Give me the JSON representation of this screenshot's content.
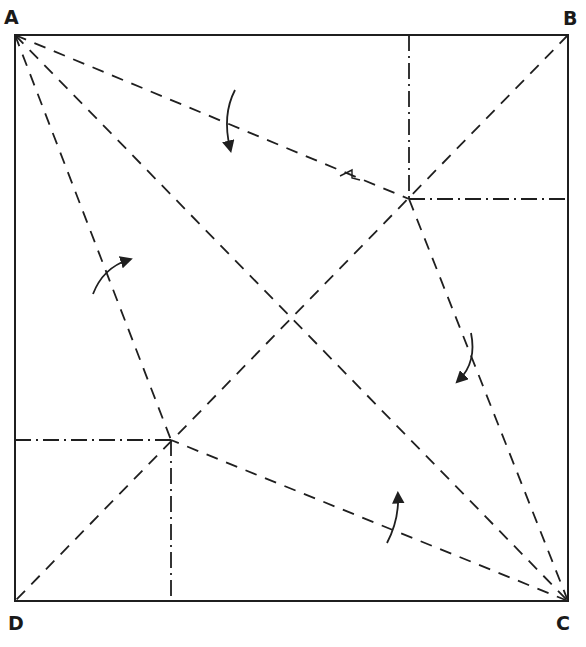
{
  "diagram": {
    "type": "origami-crease-pattern",
    "colors": {
      "line": "#1f1f1f",
      "background": "#ffffff"
    },
    "corners": {
      "A": {
        "label": "A",
        "x": 15,
        "y": 35
      },
      "B": {
        "label": "B",
        "x": 568,
        "y": 35
      },
      "C": {
        "label": "C",
        "x": 568,
        "y": 601
      },
      "D": {
        "label": "D",
        "x": 15,
        "y": 601
      }
    },
    "points": {
      "E": {
        "x": 409,
        "y": 199
      },
      "F": {
        "x": 171,
        "y": 440
      }
    },
    "valley_folds": [
      {
        "from": "A",
        "to": "C"
      },
      {
        "from": "B",
        "to": "D"
      },
      {
        "from": "A",
        "to": "E"
      },
      {
        "from": "A",
        "to": "F"
      },
      {
        "from": "C",
        "to": "E"
      },
      {
        "from": "C",
        "to": "F"
      }
    ],
    "mountain_folds": [
      {
        "from": [
          409,
          35
        ],
        "to": [
          409,
          199
        ]
      },
      {
        "from": [
          409,
          199
        ],
        "to": [
          568,
          199
        ]
      },
      {
        "from": [
          15,
          440
        ],
        "to": [
          171,
          440
        ]
      },
      {
        "from": [
          171,
          440
        ],
        "to": [
          171,
          601
        ]
      }
    ],
    "arrows": [
      {
        "name": "arrow-top",
        "direction": "down"
      },
      {
        "name": "arrow-right",
        "direction": "down-left"
      },
      {
        "name": "arrow-left",
        "direction": "up-right"
      },
      {
        "name": "arrow-bottom",
        "direction": "up"
      }
    ]
  }
}
